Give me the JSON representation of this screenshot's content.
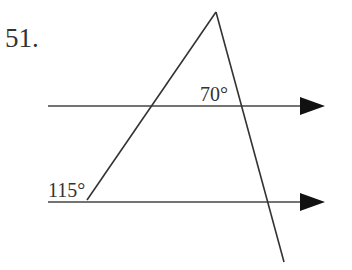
{
  "problem": {
    "number_label": "51."
  },
  "figure": {
    "type": "parallel-lines-transversals",
    "stroke_color": "#333333",
    "arrow_color": "#111111",
    "parallel_lines": [
      {
        "name": "upper-parallel-line",
        "x1": 48,
        "y1": 106,
        "x2": 302,
        "y2": 106,
        "arrow_tip_x": 325
      },
      {
        "name": "lower-parallel-line",
        "x1": 48,
        "y1": 202,
        "x2": 302,
        "y2": 202,
        "arrow_tip_x": 325
      }
    ],
    "transversals": [
      {
        "name": "left-transversal",
        "x1": 216,
        "y1": 12,
        "x2": 87,
        "y2": 200
      },
      {
        "name": "right-transversal",
        "x1": 216,
        "y1": 12,
        "x2": 284,
        "y2": 262
      }
    ],
    "angle_labels": {
      "top_angle": "70°",
      "bottom_angle": "115°"
    }
  }
}
